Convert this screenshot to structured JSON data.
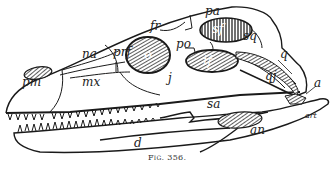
{
  "figure": {
    "caption": "Fig. 356."
  },
  "labels": {
    "pm": "pm",
    "mx": "mx",
    "na": "na",
    "prf": "prf",
    "o": "o",
    "fr": "fr",
    "j": "j",
    "po": "po",
    "pa": "pa",
    "sf": "sf",
    "if": "if",
    "sq": "sq",
    "q": "q",
    "qj": "qj",
    "a": "a",
    "d": "d",
    "sa": "sa",
    "an": "an",
    "art": "art"
  },
  "colors": {
    "ink": "#1a1a1a",
    "paper": "#ffffff",
    "hatch": "#555555"
  }
}
